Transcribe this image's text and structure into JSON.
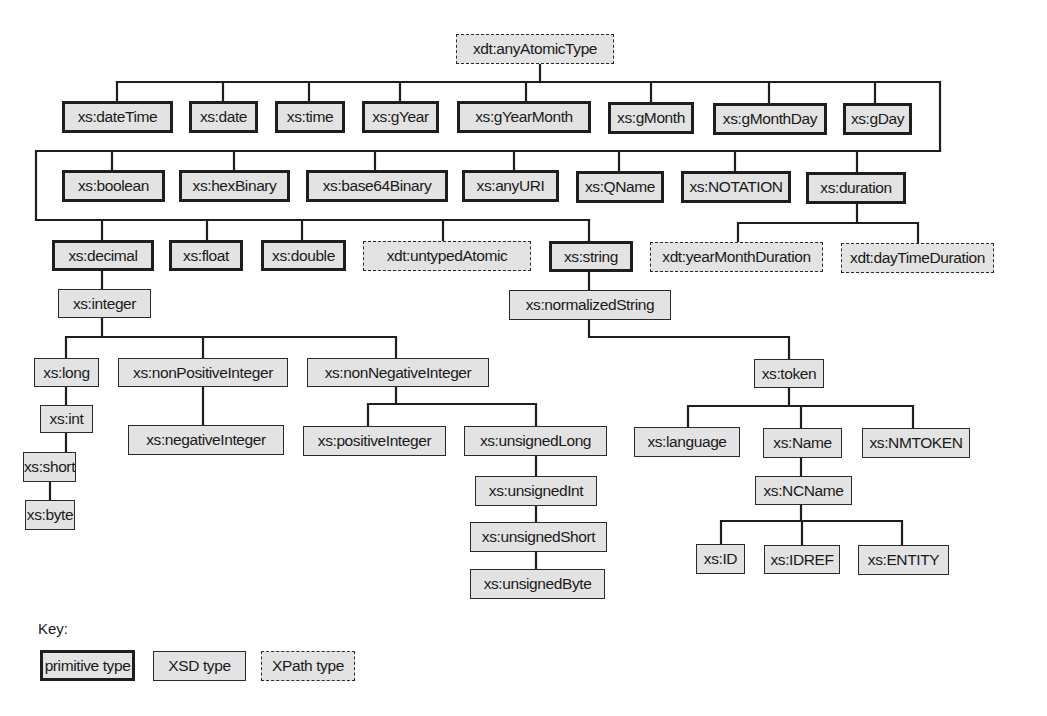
{
  "diagram": {
    "root": "xdt:anyAtomicType",
    "nodes": [
      {
        "id": "anyAtomicType",
        "label": "xdt:anyAtomicType",
        "kind": "xpath",
        "x": 456,
        "y": 34,
        "w": 158,
        "h": 30
      },
      {
        "id": "dateTime",
        "label": "xs:dateTime",
        "kind": "primitive",
        "x": 62,
        "y": 101,
        "w": 111,
        "h": 32
      },
      {
        "id": "date",
        "label": "xs:date",
        "kind": "primitive",
        "x": 189,
        "y": 101,
        "w": 69,
        "h": 32
      },
      {
        "id": "time",
        "label": "xs:time",
        "kind": "primitive",
        "x": 275,
        "y": 101,
        "w": 70,
        "h": 32
      },
      {
        "id": "gYear",
        "label": "xs:gYear",
        "kind": "primitive",
        "x": 362,
        "y": 101,
        "w": 77,
        "h": 32
      },
      {
        "id": "gYearMonth",
        "label": "xs:gYearMonth",
        "kind": "primitive",
        "x": 457,
        "y": 101,
        "w": 134,
        "h": 32
      },
      {
        "id": "gMonth",
        "label": "xs:gMonth",
        "kind": "primitive",
        "x": 608,
        "y": 102,
        "w": 86,
        "h": 32
      },
      {
        "id": "gMonthDay",
        "label": "xs:gMonthDay",
        "kind": "primitive",
        "x": 713,
        "y": 103,
        "w": 114,
        "h": 32
      },
      {
        "id": "gDay",
        "label": "xs:gDay",
        "kind": "primitive",
        "x": 843,
        "y": 103,
        "w": 69,
        "h": 32
      },
      {
        "id": "boolean",
        "label": "xs:boolean",
        "kind": "primitive",
        "x": 62,
        "y": 170,
        "w": 103,
        "h": 32
      },
      {
        "id": "hexBinary",
        "label": "xs:hexBinary",
        "kind": "primitive",
        "x": 179,
        "y": 170,
        "w": 111,
        "h": 32
      },
      {
        "id": "base64Binary",
        "label": "xs:base64Binary",
        "kind": "primitive",
        "x": 306,
        "y": 170,
        "w": 142,
        "h": 32
      },
      {
        "id": "anyURI",
        "label": "xs:anyURI",
        "kind": "primitive",
        "x": 462,
        "y": 170,
        "w": 97,
        "h": 32
      },
      {
        "id": "QName",
        "label": "xs:QName",
        "kind": "primitive",
        "x": 576,
        "y": 171,
        "w": 88,
        "h": 32
      },
      {
        "id": "NOTATION",
        "label": "xs:NOTATION",
        "kind": "primitive",
        "x": 681,
        "y": 171,
        "w": 110,
        "h": 32
      },
      {
        "id": "duration",
        "label": "xs:duration",
        "kind": "primitive",
        "x": 806,
        "y": 172,
        "w": 100,
        "h": 32
      },
      {
        "id": "decimal",
        "label": "xs:decimal",
        "kind": "primitive",
        "x": 52,
        "y": 240,
        "w": 102,
        "h": 31
      },
      {
        "id": "float",
        "label": "xs:float",
        "kind": "primitive",
        "x": 169,
        "y": 240,
        "w": 74,
        "h": 31
      },
      {
        "id": "double",
        "label": "xs:double",
        "kind": "primitive",
        "x": 261,
        "y": 240,
        "w": 85,
        "h": 31
      },
      {
        "id": "untypedAtomic",
        "label": "xdt:untypedAtomic",
        "kind": "xpath",
        "x": 363,
        "y": 241,
        "w": 168,
        "h": 30
      },
      {
        "id": "string",
        "label": "xs:string",
        "kind": "primitive",
        "x": 549,
        "y": 241,
        "w": 84,
        "h": 31
      },
      {
        "id": "yearMonthDuration",
        "label": "xdt:yearMonthDuration",
        "kind": "xpath",
        "x": 650,
        "y": 242,
        "w": 173,
        "h": 30
      },
      {
        "id": "dayTimeDuration",
        "label": "xdt:dayTimeDuration",
        "kind": "xpath",
        "x": 841,
        "y": 243,
        "w": 153,
        "h": 30
      },
      {
        "id": "integer",
        "label": "xs:integer",
        "kind": "xsd",
        "x": 58,
        "y": 289,
        "w": 93,
        "h": 29
      },
      {
        "id": "normalizedString",
        "label": "xs:normalizedString",
        "kind": "xsd",
        "x": 509,
        "y": 290,
        "w": 162,
        "h": 30
      },
      {
        "id": "long",
        "label": "xs:long",
        "kind": "xsd",
        "x": 34,
        "y": 358,
        "w": 65,
        "h": 29
      },
      {
        "id": "nonPositiveInteger",
        "label": "xs:nonPositiveInteger",
        "kind": "xsd",
        "x": 118,
        "y": 358,
        "w": 170,
        "h": 29
      },
      {
        "id": "nonNegativeInteger",
        "label": "xs:nonNegativeInteger",
        "kind": "xsd",
        "x": 307,
        "y": 358,
        "w": 182,
        "h": 29
      },
      {
        "id": "token",
        "label": "xs:token",
        "kind": "xsd",
        "x": 754,
        "y": 359,
        "w": 70,
        "h": 29
      },
      {
        "id": "int",
        "label": "xs:int",
        "kind": "xsd",
        "x": 40,
        "y": 405,
        "w": 53,
        "h": 28
      },
      {
        "id": "negativeInteger",
        "label": "xs:negativeInteger",
        "kind": "xsd",
        "x": 128,
        "y": 425,
        "w": 156,
        "h": 30
      },
      {
        "id": "positiveInteger",
        "label": "xs:positiveInteger",
        "kind": "xsd",
        "x": 303,
        "y": 426,
        "w": 143,
        "h": 30
      },
      {
        "id": "unsignedLong",
        "label": "xs:unsignedLong",
        "kind": "xsd",
        "x": 464,
        "y": 426,
        "w": 143,
        "h": 30
      },
      {
        "id": "language",
        "label": "xs:language",
        "kind": "xsd",
        "x": 634,
        "y": 427,
        "w": 106,
        "h": 30
      },
      {
        "id": "Name",
        "label": "xs:Name",
        "kind": "xsd",
        "x": 763,
        "y": 428,
        "w": 79,
        "h": 30
      },
      {
        "id": "NMTOKEN",
        "label": "xs:NMTOKEN",
        "kind": "xsd",
        "x": 862,
        "y": 428,
        "w": 108,
        "h": 30
      },
      {
        "id": "short",
        "label": "xs:short",
        "kind": "xsd",
        "x": 23,
        "y": 452,
        "w": 53,
        "h": 30
      },
      {
        "id": "unsignedInt",
        "label": "xs:unsignedInt",
        "kind": "xsd",
        "x": 475,
        "y": 476,
        "w": 122,
        "h": 30
      },
      {
        "id": "NCName",
        "label": "xs:NCName",
        "kind": "xsd",
        "x": 755,
        "y": 476,
        "w": 97,
        "h": 29
      },
      {
        "id": "byte",
        "label": "xs:byte",
        "kind": "xsd",
        "x": 25,
        "y": 500,
        "w": 50,
        "h": 30
      },
      {
        "id": "unsignedShort",
        "label": "xs:unsignedShort",
        "kind": "xsd",
        "x": 470,
        "y": 522,
        "w": 137,
        "h": 30
      },
      {
        "id": "ID",
        "label": "xs:ID",
        "kind": "xsd",
        "x": 696,
        "y": 544,
        "w": 49,
        "h": 30
      },
      {
        "id": "IDREF",
        "label": "xs:IDREF",
        "kind": "xsd",
        "x": 764,
        "y": 545,
        "w": 76,
        "h": 29
      },
      {
        "id": "ENTITY",
        "label": "xs:ENTITY",
        "kind": "xsd",
        "x": 858,
        "y": 545,
        "w": 91,
        "h": 30
      },
      {
        "id": "unsignedByte",
        "label": "xs:unsignedByte",
        "kind": "xsd",
        "x": 470,
        "y": 569,
        "w": 135,
        "h": 30
      }
    ],
    "edges": [
      [
        "anyAtomicType",
        "dateTime"
      ],
      [
        "anyAtomicType",
        "date"
      ],
      [
        "anyAtomicType",
        "time"
      ],
      [
        "anyAtomicType",
        "gYear"
      ],
      [
        "anyAtomicType",
        "gYearMonth"
      ],
      [
        "anyAtomicType",
        "gMonth"
      ],
      [
        "anyAtomicType",
        "gMonthDay"
      ],
      [
        "anyAtomicType",
        "gDay"
      ],
      [
        "anyAtomicType",
        "boolean"
      ],
      [
        "anyAtomicType",
        "hexBinary"
      ],
      [
        "anyAtomicType",
        "base64Binary"
      ],
      [
        "anyAtomicType",
        "anyURI"
      ],
      [
        "anyAtomicType",
        "QName"
      ],
      [
        "anyAtomicType",
        "NOTATION"
      ],
      [
        "anyAtomicType",
        "duration"
      ],
      [
        "anyAtomicType",
        "decimal"
      ],
      [
        "anyAtomicType",
        "float"
      ],
      [
        "anyAtomicType",
        "double"
      ],
      [
        "anyAtomicType",
        "untypedAtomic"
      ],
      [
        "anyAtomicType",
        "string"
      ],
      [
        "duration",
        "yearMonthDuration"
      ],
      [
        "duration",
        "dayTimeDuration"
      ],
      [
        "decimal",
        "integer"
      ],
      [
        "integer",
        "long"
      ],
      [
        "integer",
        "nonPositiveInteger"
      ],
      [
        "integer",
        "nonNegativeInteger"
      ],
      [
        "long",
        "int"
      ],
      [
        "int",
        "short"
      ],
      [
        "short",
        "byte"
      ],
      [
        "nonPositiveInteger",
        "negativeInteger"
      ],
      [
        "nonNegativeInteger",
        "positiveInteger"
      ],
      [
        "nonNegativeInteger",
        "unsignedLong"
      ],
      [
        "unsignedLong",
        "unsignedInt"
      ],
      [
        "unsignedInt",
        "unsignedShort"
      ],
      [
        "unsignedShort",
        "unsignedByte"
      ],
      [
        "string",
        "normalizedString"
      ],
      [
        "normalizedString",
        "token"
      ],
      [
        "token",
        "language"
      ],
      [
        "token",
        "Name"
      ],
      [
        "token",
        "NMTOKEN"
      ],
      [
        "Name",
        "NCName"
      ],
      [
        "NCName",
        "ID"
      ],
      [
        "NCName",
        "IDREF"
      ],
      [
        "NCName",
        "ENTITY"
      ]
    ]
  },
  "key": {
    "title": "Key:",
    "items": [
      {
        "label": "primitive type",
        "kind": "primitive",
        "x": 40,
        "y": 650,
        "w": 95,
        "h": 31
      },
      {
        "label": "XSD type",
        "kind": "xsd",
        "x": 153,
        "y": 651,
        "w": 93,
        "h": 30
      },
      {
        "label": "XPath type",
        "kind": "xpath",
        "x": 261,
        "y": 651,
        "w": 94,
        "h": 30
      }
    ]
  },
  "colors": {
    "box_fill": "#e3e3e3",
    "line": "#1e1e1e",
    "text": "#1a1a1a",
    "background": "#ffffff"
  }
}
